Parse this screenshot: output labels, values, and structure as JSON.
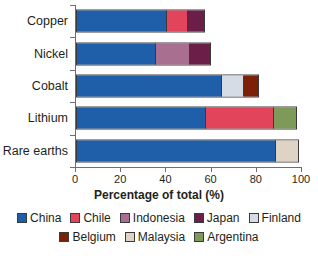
{
  "chart_data": {
    "type": "bar",
    "orientation": "horizontal",
    "stacked": true,
    "title": "",
    "xlabel": "Percentage of total (%)",
    "ylabel": "",
    "xlim": [
      0,
      100
    ],
    "xticks": [
      0,
      20,
      40,
      60,
      80,
      100
    ],
    "xtick_labels": [
      "0",
      "20",
      "40",
      "60",
      "80",
      "100"
    ],
    "grid": false,
    "legend_position": "bottom",
    "categories": [
      "Copper",
      "Nickel",
      "Cobalt",
      "Lithium",
      "Rare earths"
    ],
    "series": [
      {
        "name": "China",
        "color": "#1f5fa9",
        "values": [
          40,
          35,
          64,
          57,
          88
        ]
      },
      {
        "name": "Chile",
        "color": "#e2445c",
        "values": [
          9,
          0,
          0,
          30,
          0
        ]
      },
      {
        "name": "Indonesia",
        "color": "#a96f90",
        "values": [
          0,
          15,
          0,
          0,
          0
        ]
      },
      {
        "name": "Japan",
        "color": "#6b1f48",
        "values": [
          7,
          9,
          0,
          0,
          0
        ]
      },
      {
        "name": "Finland",
        "color": "#d5dce6",
        "values": [
          0,
          0,
          10,
          0,
          0
        ]
      },
      {
        "name": "Belgium",
        "color": "#7c2008",
        "values": [
          0,
          0,
          6,
          0,
          0
        ]
      },
      {
        "name": "Malaysia",
        "color": "#ded3c4",
        "values": [
          0,
          0,
          0,
          0,
          10
        ]
      },
      {
        "name": "Argentina",
        "color": "#7d9a58",
        "values": [
          0,
          0,
          0,
          10,
          0
        ]
      }
    ],
    "bars": [
      {
        "category": "Copper",
        "total": 56,
        "segments": [
          {
            "name": "China",
            "value": 40,
            "color": "#1f5fa9"
          },
          {
            "name": "Chile",
            "value": 9,
            "color": "#e2445c"
          },
          {
            "name": "Japan",
            "value": 7,
            "color": "#6b1f48"
          }
        ]
      },
      {
        "category": "Nickel",
        "total": 59,
        "segments": [
          {
            "name": "China",
            "value": 35,
            "color": "#1f5fa9"
          },
          {
            "name": "Indonesia",
            "value": 15,
            "color": "#a96f90"
          },
          {
            "name": "Japan",
            "value": 9,
            "color": "#6b1f48"
          }
        ]
      },
      {
        "category": "Cobalt",
        "total": 80,
        "segments": [
          {
            "name": "China",
            "value": 64,
            "color": "#1f5fa9"
          },
          {
            "name": "Finland",
            "value": 10,
            "color": "#d5dce6"
          },
          {
            "name": "Belgium",
            "value": 6,
            "color": "#7c2008"
          }
        ]
      },
      {
        "category": "Lithium",
        "total": 97,
        "segments": [
          {
            "name": "China",
            "value": 57,
            "color": "#1f5fa9"
          },
          {
            "name": "Chile",
            "value": 30,
            "color": "#e2445c"
          },
          {
            "name": "Argentina",
            "value": 10,
            "color": "#7d9a58"
          }
        ]
      },
      {
        "category": "Rare earths",
        "total": 98,
        "segments": [
          {
            "name": "China",
            "value": 88,
            "color": "#1f5fa9"
          },
          {
            "name": "Malaysia",
            "value": 10,
            "color": "#ded3c4"
          }
        ]
      }
    ],
    "legend": [
      [
        {
          "label": "China",
          "color": "#1f5fa9"
        },
        {
          "label": "Chile",
          "color": "#e2445c"
        },
        {
          "label": "Indonesia",
          "color": "#a96f90"
        },
        {
          "label": "Japan",
          "color": "#6b1f48"
        },
        {
          "label": "Finland",
          "color": "#d5dce6"
        }
      ],
      [
        {
          "label": "Belgium",
          "color": "#7c2008"
        },
        {
          "label": "Malaysia",
          "color": "#ded3c4"
        },
        {
          "label": "Argentina",
          "color": "#7d9a58"
        }
      ]
    ]
  }
}
